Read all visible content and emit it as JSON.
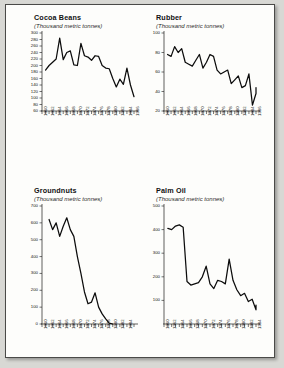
{
  "page": {
    "background_color": "#fdfdfb",
    "border_color": "#4a4a48",
    "line_color": "#0c0c0c"
  },
  "chart_data": [
    {
      "type": "line",
      "title": "Cocoa Beans",
      "subtitle": "(Thousand metric tonnes)",
      "xlabel": "",
      "ylabel": "",
      "grid": false,
      "legend": "none",
      "xlim": [
        1960,
        1986
      ],
      "ylim": [
        60,
        300
      ],
      "yticks": [
        60,
        80,
        100,
        120,
        140,
        160,
        180,
        200,
        220,
        240,
        260,
        280,
        300
      ],
      "xticks": [
        1960,
        1962,
        1964,
        1966,
        1968,
        1970,
        1972,
        1974,
        1976,
        1978,
        1980,
        1982,
        1984,
        1986
      ],
      "x": [
        1961,
        1962,
        1963,
        1964,
        1965,
        1966,
        1967,
        1968,
        1969,
        1970,
        1971,
        1972,
        1973,
        1974,
        1975,
        1976,
        1977,
        1978,
        1979,
        1980,
        1981,
        1982,
        1983,
        1984,
        1985
      ],
      "values": [
        186,
        200,
        210,
        220,
        284,
        218,
        240,
        245,
        202,
        200,
        268,
        230,
        226,
        216,
        230,
        228,
        200,
        192,
        190,
        160,
        134,
        158,
        142,
        192,
        140,
        104
      ]
    },
    {
      "type": "line",
      "title": "Rubber",
      "subtitle": "(Thousand metric tonnes)",
      "xlabel": "",
      "ylabel": "",
      "grid": false,
      "legend": "none",
      "xlim": [
        1960,
        1986
      ],
      "ylim": [
        20,
        100
      ],
      "yticks": [
        20,
        40,
        60,
        80,
        100
      ],
      "xticks": [
        1960,
        1962,
        1964,
        1966,
        1968,
        1970,
        1972,
        1974,
        1976,
        1978,
        1980,
        1982,
        1984,
        1986
      ],
      "x": [
        1961,
        1962,
        1963,
        1964,
        1965,
        1966,
        1967,
        1968,
        1969,
        1970,
        1971,
        1972,
        1973,
        1974,
        1975,
        1976,
        1977,
        1978,
        1979,
        1980,
        1981,
        1982,
        1983,
        1984,
        1985,
        1986
      ],
      "values": [
        78,
        76,
        86,
        80,
        84,
        70,
        68,
        66,
        72,
        78,
        64,
        70,
        78,
        76,
        62,
        58,
        60,
        62,
        48,
        52,
        56,
        44,
        46,
        58,
        26,
        38,
        44
      ]
    },
    {
      "type": "line",
      "title": "Groundnuts",
      "subtitle": "(Thousand metric tonnes)",
      "xlabel": "",
      "ylabel": "",
      "grid": false,
      "legend": "none",
      "xlim": [
        1960,
        1986
      ],
      "ylim": [
        0,
        700
      ],
      "yticks": [
        0,
        100,
        200,
        300,
        400,
        500,
        600,
        700
      ],
      "xticks": [
        1960,
        1962,
        1964,
        1966,
        1968,
        1970,
        1972,
        1974,
        1976,
        1978,
        1980,
        1982,
        1984
      ],
      "x": [
        1962,
        1963,
        1964,
        1965,
        1966,
        1967,
        1968,
        1969,
        1970,
        1971,
        1972,
        1973,
        1974,
        1975,
        1976,
        1977
      ],
      "values": [
        620,
        560,
        600,
        520,
        580,
        630,
        560,
        520,
        400,
        300,
        190,
        120,
        130,
        185,
        100,
        60,
        30,
        5,
        0
      ]
    },
    {
      "type": "line",
      "title": "Palm Oil",
      "subtitle": "(Thousand metric tonnes)",
      "xlabel": "",
      "ylabel": "",
      "grid": false,
      "legend": "none",
      "xlim": [
        1960,
        1984
      ],
      "ylim": [
        0,
        500
      ],
      "yticks": [
        100,
        200,
        300,
        400,
        500
      ],
      "xticks": [
        1960,
        1962,
        1964,
        1966,
        1968,
        1970,
        1972,
        1974,
        1976,
        1978,
        1980,
        1982,
        1984
      ],
      "x": [
        1961,
        1962,
        1963,
        1964,
        1965,
        1966,
        1967,
        1968,
        1969,
        1970,
        1971,
        1972,
        1973,
        1974,
        1975,
        1976,
        1977,
        1978,
        1979,
        1980,
        1981,
        1982,
        1983
      ],
      "values": [
        405,
        400,
        415,
        420,
        410,
        180,
        165,
        170,
        175,
        200,
        245,
        170,
        150,
        185,
        180,
        170,
        275,
        185,
        145,
        120,
        130,
        95,
        105,
        60,
        80,
        78
      ]
    }
  ]
}
